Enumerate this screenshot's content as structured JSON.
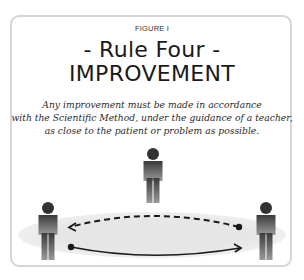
{
  "figure": {
    "label": "FIGURE I",
    "title_line1": "- Rule Four -",
    "title_line2": "IMPROVEMENT",
    "caption_lines": [
      "Any improvement must be made in accordance",
      "with the Scientific Method, under the guidance of a teacher,",
      "as close to the patient or problem as possible."
    ]
  },
  "diagram": {
    "people": [
      {
        "role": "teacher",
        "position": "top-center"
      },
      {
        "role": "person-left",
        "position": "bottom-left"
      },
      {
        "role": "person-right",
        "position": "bottom-right"
      }
    ],
    "arrows": [
      {
        "style": "dashed",
        "direction": "right-to-left"
      },
      {
        "style": "solid",
        "direction": "left-to-right"
      }
    ],
    "colors": {
      "frame_border": "#d6d6d6",
      "ellipse_fill": "#e9e9e9",
      "figure_dark": "#3a3a3a",
      "figure_light": "#8a8a8a",
      "arrow": "#1a1a1a"
    }
  }
}
